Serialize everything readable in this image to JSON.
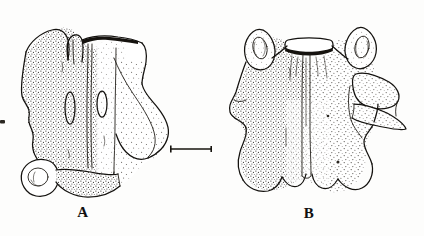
{
  "figure": {
    "kind": "scientific-line-drawing",
    "background_color": "#fdfdfc",
    "ink_color": "#14120f",
    "width": 424,
    "height": 236
  },
  "labels": {
    "panel_a": "A",
    "panel_b": "B"
  },
  "scale_bar": {
    "x_start": 170,
    "x_end": 212,
    "y": 149,
    "length_px": 42,
    "has_end_ticks": true,
    "caption": ""
  },
  "specimens": [
    {
      "id": "A",
      "label": "A",
      "view": "lateral-oblique",
      "bounds": {
        "x": 18,
        "y": 26,
        "width": 155,
        "height": 170
      },
      "features": [
        "paired elongate foramina flanking midline ridge",
        "midline sagittal ridge",
        "dorsolateral process upper left",
        "broad posterolateral wing right side",
        "oval articular facet lower left",
        "stipple shading on left half"
      ]
    },
    {
      "id": "B",
      "label": "B",
      "view": "dorsal",
      "bounds": {
        "x": 228,
        "y": 16,
        "width": 168,
        "height": 180
      },
      "features": [
        "paired anterolateral horn-like processes with oval depressions",
        "open neural canal at top margin",
        "central midline ridge running full length",
        "lateral transverse processes both sides",
        "displaced / fractured plate on right margin",
        "scalloped posterior margin",
        "dense stipple shading over surface"
      ]
    }
  ],
  "marks": {
    "left_edge_smudge": {
      "x": 0,
      "y": 120,
      "width": 5,
      "height": 4
    }
  }
}
